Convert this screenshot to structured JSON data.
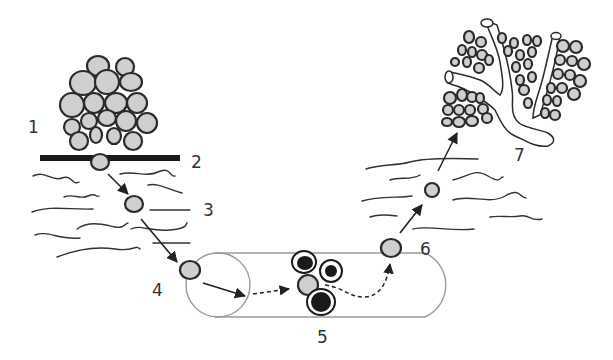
{
  "diagram": {
    "topic": "Cancer metastasis cascade",
    "step_labels": [
      {
        "id": 1,
        "text": "1",
        "x": 32,
        "y": 133
      },
      {
        "id": 2,
        "text": "2",
        "x": 191,
        "y": 168
      },
      {
        "id": 3,
        "text": "3",
        "x": 203,
        "y": 217
      },
      {
        "id": 4,
        "text": "4",
        "x": 153,
        "y": 295
      },
      {
        "id": 5,
        "text": "5",
        "x": 318,
        "y": 342
      },
      {
        "id": 6,
        "text": "6",
        "x": 421,
        "y": 254
      },
      {
        "id": 7,
        "text": "7",
        "x": 515,
        "y": 160
      }
    ],
    "elements": {
      "primary_tumor": "cluster of grey cells above basement membrane",
      "basement_membrane": "thick black bar",
      "stroma": "wavy lines representing tissue",
      "blood_vessel": "cylinder with circulating cells",
      "secondary_site": "branching ducts with colonizing cells"
    },
    "colors": {
      "cell_fill": "#cfcfcf",
      "cell_outline": "#2a2a2a",
      "immune_cell_core": "#1a1a1a",
      "vessel_outline": "#9a9a9a",
      "membrane": "#1a1a1a"
    }
  }
}
